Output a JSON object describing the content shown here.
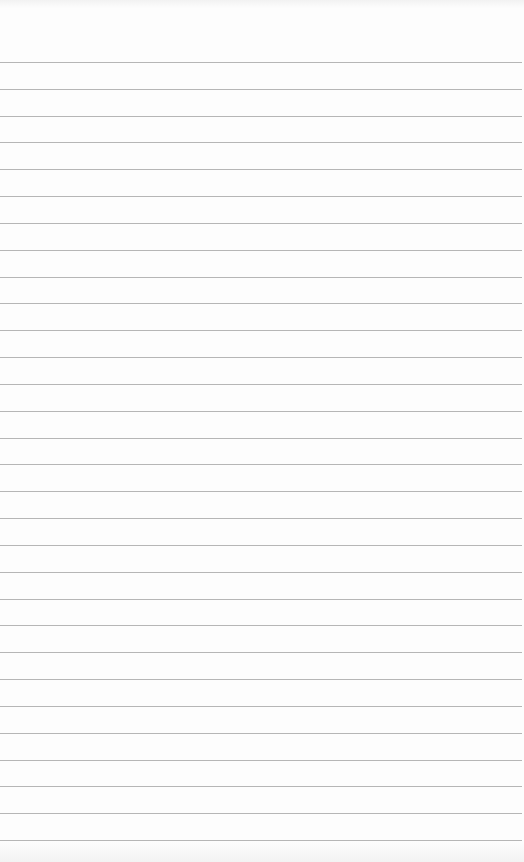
{
  "page": {
    "type": "ruled-notepaper",
    "background_color": "#fdfdfd",
    "rule_color": "#a9a9a9",
    "rule_count": 30,
    "first_rule_y": 62,
    "rule_spacing": 26.83,
    "text_lines": []
  }
}
